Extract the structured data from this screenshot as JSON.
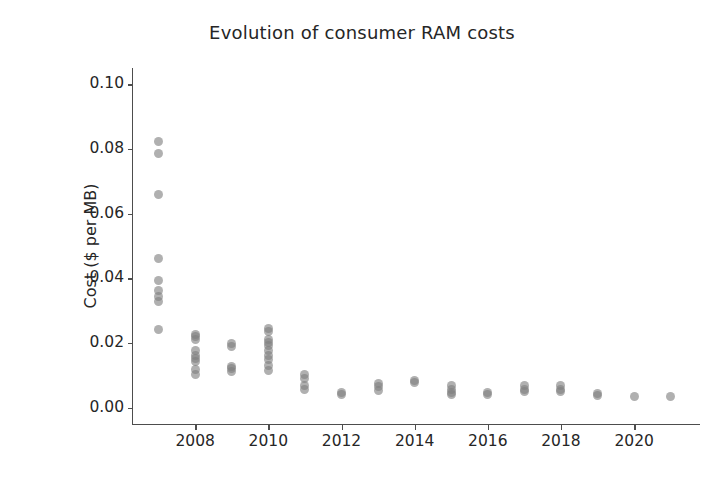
{
  "chart_data": {
    "type": "scatter",
    "title": "Evolution of consumer RAM costs",
    "xlabel": "",
    "ylabel": "Cost ($ per MB)",
    "xlim": [
      2006.3,
      2021.8
    ],
    "ylim": [
      -0.005,
      0.105
    ],
    "grid": false,
    "legend": null,
    "marker": {
      "shape": "circle",
      "color": "#808080",
      "opacity": 0.62,
      "size_px": 9
    },
    "ytick_labels": [
      "0.00",
      "0.02",
      "0.04",
      "0.06",
      "0.08",
      "0.10"
    ],
    "ytick_values": [
      0.0,
      0.02,
      0.04,
      0.06,
      0.08,
      0.1
    ],
    "xtick_labels": [
      "2008",
      "2010",
      "2012",
      "2014",
      "2016",
      "2018",
      "2020"
    ],
    "xtick_values": [
      2008,
      2010,
      2012,
      2014,
      2016,
      2018,
      2020
    ],
    "series": [
      {
        "name": "consumer RAM cost",
        "points": [
          {
            "x": 2007,
            "y": 0.0822
          },
          {
            "x": 2007,
            "y": 0.0785
          },
          {
            "x": 2007,
            "y": 0.066
          },
          {
            "x": 2007,
            "y": 0.0462
          },
          {
            "x": 2007,
            "y": 0.0392
          },
          {
            "x": 2007,
            "y": 0.0362
          },
          {
            "x": 2007,
            "y": 0.0345
          },
          {
            "x": 2007,
            "y": 0.033
          },
          {
            "x": 2007,
            "y": 0.0242
          },
          {
            "x": 2008,
            "y": 0.0228
          },
          {
            "x": 2008,
            "y": 0.022
          },
          {
            "x": 2008,
            "y": 0.0212
          },
          {
            "x": 2008,
            "y": 0.0178
          },
          {
            "x": 2008,
            "y": 0.0162
          },
          {
            "x": 2008,
            "y": 0.0152
          },
          {
            "x": 2008,
            "y": 0.0142
          },
          {
            "x": 2008,
            "y": 0.0118
          },
          {
            "x": 2008,
            "y": 0.0102
          },
          {
            "x": 2009,
            "y": 0.02
          },
          {
            "x": 2009,
            "y": 0.019
          },
          {
            "x": 2009,
            "y": 0.0128
          },
          {
            "x": 2009,
            "y": 0.012
          },
          {
            "x": 2009,
            "y": 0.0112
          },
          {
            "x": 2010,
            "y": 0.0245
          },
          {
            "x": 2010,
            "y": 0.0235
          },
          {
            "x": 2010,
            "y": 0.0212
          },
          {
            "x": 2010,
            "y": 0.0202
          },
          {
            "x": 2010,
            "y": 0.0192
          },
          {
            "x": 2010,
            "y": 0.0178
          },
          {
            "x": 2010,
            "y": 0.0162
          },
          {
            "x": 2010,
            "y": 0.0148
          },
          {
            "x": 2010,
            "y": 0.0132
          },
          {
            "x": 2010,
            "y": 0.0115
          },
          {
            "x": 2011,
            "y": 0.0102
          },
          {
            "x": 2011,
            "y": 0.0092
          },
          {
            "x": 2011,
            "y": 0.0068
          },
          {
            "x": 2011,
            "y": 0.0058
          },
          {
            "x": 2012,
            "y": 0.0048
          },
          {
            "x": 2012,
            "y": 0.0042
          },
          {
            "x": 2013,
            "y": 0.0075
          },
          {
            "x": 2013,
            "y": 0.0065
          },
          {
            "x": 2013,
            "y": 0.0055
          },
          {
            "x": 2014,
            "y": 0.0085
          },
          {
            "x": 2014,
            "y": 0.0078
          },
          {
            "x": 2015,
            "y": 0.007
          },
          {
            "x": 2015,
            "y": 0.0058
          },
          {
            "x": 2015,
            "y": 0.0048
          },
          {
            "x": 2015,
            "y": 0.0042
          },
          {
            "x": 2016,
            "y": 0.0048
          },
          {
            "x": 2016,
            "y": 0.004
          },
          {
            "x": 2017,
            "y": 0.0068
          },
          {
            "x": 2017,
            "y": 0.0058
          },
          {
            "x": 2017,
            "y": 0.005
          },
          {
            "x": 2018,
            "y": 0.0068
          },
          {
            "x": 2018,
            "y": 0.0058
          },
          {
            "x": 2018,
            "y": 0.005
          },
          {
            "x": 2019,
            "y": 0.0045
          },
          {
            "x": 2019,
            "y": 0.0038
          },
          {
            "x": 2020,
            "y": 0.0036
          },
          {
            "x": 2021,
            "y": 0.0035
          }
        ]
      }
    ]
  }
}
